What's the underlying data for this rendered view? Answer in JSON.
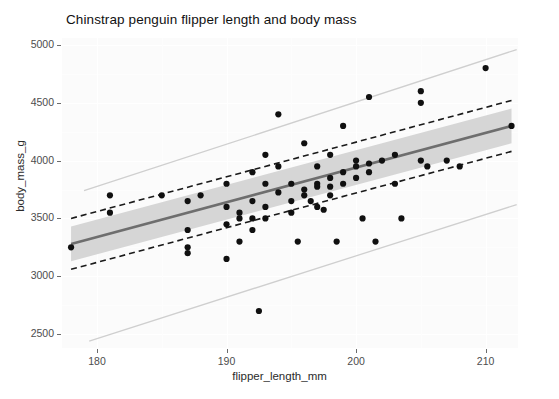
{
  "chart_data": {
    "type": "scatter",
    "title": "Chinstrap penguin flipper length and body mass",
    "xlabel": "flipper_length_mm",
    "ylabel": "body_mass_g",
    "xlim": [
      177.3,
      212.5
    ],
    "ylim": [
      2380,
      5060
    ],
    "xticks": [
      180,
      190,
      200,
      210
    ],
    "yticks": [
      2500,
      3000,
      3500,
      4000,
      4500,
      5000
    ],
    "grid": true,
    "legend": "none",
    "point_color": "#101010",
    "fit_line_color": "#6e6e6e",
    "ribbon_color": "#d6d6d6",
    "interval_line_color": "#1a1a1a",
    "reference_line_color": "#cfcfcf",
    "panel_background": "#fbfbfb",
    "points": [
      {
        "x": 178.0,
        "y": 3250
      },
      {
        "x": 181.0,
        "y": 3700
      },
      {
        "x": 181.0,
        "y": 3550
      },
      {
        "x": 185.0,
        "y": 3700
      },
      {
        "x": 187.0,
        "y": 3650
      },
      {
        "x": 187.0,
        "y": 3400
      },
      {
        "x": 187.0,
        "y": 3250
      },
      {
        "x": 187.0,
        "y": 3200
      },
      {
        "x": 188.0,
        "y": 3700
      },
      {
        "x": 190.0,
        "y": 3800
      },
      {
        "x": 190.0,
        "y": 3600
      },
      {
        "x": 190.0,
        "y": 3450
      },
      {
        "x": 190.0,
        "y": 3150
      },
      {
        "x": 191.0,
        "y": 3550
      },
      {
        "x": 191.0,
        "y": 3500
      },
      {
        "x": 191.0,
        "y": 3300
      },
      {
        "x": 192.0,
        "y": 3900
      },
      {
        "x": 192.0,
        "y": 3650
      },
      {
        "x": 192.0,
        "y": 3500
      },
      {
        "x": 192.0,
        "y": 3400
      },
      {
        "x": 192.5,
        "y": 2700
      },
      {
        "x": 193.0,
        "y": 4050
      },
      {
        "x": 193.0,
        "y": 3800
      },
      {
        "x": 193.0,
        "y": 3600
      },
      {
        "x": 193.0,
        "y": 3500
      },
      {
        "x": 194.0,
        "y": 4400
      },
      {
        "x": 194.0,
        "y": 3950
      },
      {
        "x": 194.0,
        "y": 3725
      },
      {
        "x": 195.0,
        "y": 3800
      },
      {
        "x": 195.0,
        "y": 3650
      },
      {
        "x": 195.0,
        "y": 3550
      },
      {
        "x": 195.5,
        "y": 3300
      },
      {
        "x": 196.0,
        "y": 4150
      },
      {
        "x": 196.0,
        "y": 3750
      },
      {
        "x": 196.0,
        "y": 3700
      },
      {
        "x": 196.5,
        "y": 3650
      },
      {
        "x": 197.0,
        "y": 3950
      },
      {
        "x": 197.0,
        "y": 3800
      },
      {
        "x": 197.0,
        "y": 3775
      },
      {
        "x": 197.0,
        "y": 3600
      },
      {
        "x": 197.5,
        "y": 3575
      },
      {
        "x": 198.0,
        "y": 4050
      },
      {
        "x": 198.0,
        "y": 3850
      },
      {
        "x": 198.0,
        "y": 3775
      },
      {
        "x": 198.0,
        "y": 3700
      },
      {
        "x": 198.5,
        "y": 3300
      },
      {
        "x": 199.0,
        "y": 4300
      },
      {
        "x": 199.0,
        "y": 3900
      },
      {
        "x": 199.0,
        "y": 3800
      },
      {
        "x": 200.0,
        "y": 4000
      },
      {
        "x": 200.0,
        "y": 3950
      },
      {
        "x": 200.0,
        "y": 3850
      },
      {
        "x": 200.5,
        "y": 3500
      },
      {
        "x": 201.0,
        "y": 4550
      },
      {
        "x": 201.0,
        "y": 3975
      },
      {
        "x": 201.0,
        "y": 3900
      },
      {
        "x": 201.5,
        "y": 3300
      },
      {
        "x": 202.0,
        "y": 4000
      },
      {
        "x": 203.0,
        "y": 4050
      },
      {
        "x": 203.0,
        "y": 3800
      },
      {
        "x": 203.5,
        "y": 3500
      },
      {
        "x": 205.0,
        "y": 4600
      },
      {
        "x": 205.0,
        "y": 4500
      },
      {
        "x": 205.0,
        "y": 4000
      },
      {
        "x": 205.5,
        "y": 3950
      },
      {
        "x": 207.0,
        "y": 4000
      },
      {
        "x": 208.0,
        "y": 3950
      },
      {
        "x": 210.0,
        "y": 4800
      },
      {
        "x": 212.0,
        "y": 4300
      }
    ],
    "fit_line": {
      "description": "linear regression of body_mass_g on flipper_length_mm",
      "x_start": 178.0,
      "y_start": 3280,
      "x_end": 212.0,
      "y_end": 4300
    },
    "confidence_band": {
      "description": "shaded 95% confidence ribbon around fit",
      "lower_start": 3130,
      "upper_start": 3430,
      "lower_end": 4150,
      "upper_end": 4450
    },
    "interval_lines": {
      "style": "dashed",
      "lower_start": 3060,
      "upper_start": 3500,
      "lower_end": 4080,
      "upper_end": 4520
    },
    "reference_lines": [
      {
        "name": "upper-reference",
        "x_start": 179.0,
        "y_start": 3740,
        "x_end": 212.4,
        "y_end": 4960
      },
      {
        "name": "lower-reference",
        "x_start": 179.4,
        "y_start": 2440,
        "x_end": 212.4,
        "y_end": 3620
      }
    ]
  }
}
